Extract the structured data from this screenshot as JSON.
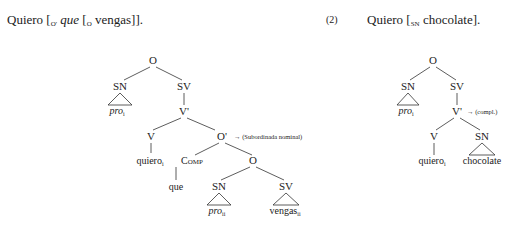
{
  "example1": {
    "verb": "Quiero",
    "bracket1_label": "O'",
    "complementizer": "que",
    "bracket2_label": "O",
    "word": "vengas",
    "close": "]]."
  },
  "example2": {
    "number": "(2)",
    "verb": "Quiero",
    "bracket_label": "SN",
    "word": "chocolate",
    "close": "]."
  },
  "tree1": {
    "root": "O",
    "sn": "SN",
    "sv": "SV",
    "pro": "pro",
    "pro_sub": "i",
    "vbar": "V'",
    "v": "V",
    "obar": "O'",
    "obar_note": "→ (Subordinada nominal)",
    "verb_leaf": "quiero",
    "verb_sub": "i",
    "comp": "Comp",
    "comp_leaf": "que",
    "o": "O",
    "sn2": "SN",
    "sv2": "SV",
    "pro2": "pro",
    "pro2_sub": "ii",
    "vengas": "vengas",
    "vengas_sub": "ii"
  },
  "tree2": {
    "root": "O",
    "sn": "SN",
    "sv": "SV",
    "pro": "pro",
    "pro_sub": "i",
    "vbar": "V'",
    "vbar_note": "→ (compl.)",
    "v": "V",
    "sn2": "SN",
    "verb_leaf": "quiero",
    "verb_sub": "i",
    "obj": "chocolate"
  }
}
